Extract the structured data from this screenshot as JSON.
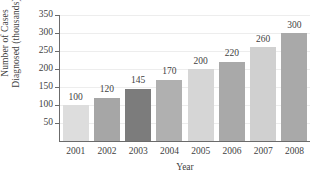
{
  "chart_data": {
    "type": "bar",
    "title": "",
    "subtitle": "",
    "xlabel": "Year",
    "ylabel_line1": "Number of Cases",
    "ylabel_line2": "Diagnosed (thousands)",
    "categories": [
      "2001",
      "2002",
      "2003",
      "2004",
      "2005",
      "2006",
      "2007",
      "2008"
    ],
    "values": [
      100,
      120,
      145,
      170,
      200,
      220,
      260,
      300
    ],
    "value_labels": [
      "100",
      "120",
      "145",
      "170",
      "200",
      "220",
      "260",
      "300"
    ],
    "bar_colors": [
      "#dddddd",
      "#a6a6a6",
      "#7c7c7c",
      "#b0b0b0",
      "#d6d6d6",
      "#a9a9a9",
      "#d0d0d0",
      "#a9a9a9"
    ],
    "ylim": [
      0,
      350
    ],
    "ytick_values": [
      50,
      100,
      150,
      200,
      250,
      300,
      350
    ],
    "ytick_labels": [
      "50",
      "100",
      "150",
      "200",
      "250",
      "300",
      "350"
    ],
    "grid": true,
    "grid_color": "#ededed",
    "axis_color": "#6b6b6b",
    "legend": "none",
    "background": "#ffffff"
  }
}
